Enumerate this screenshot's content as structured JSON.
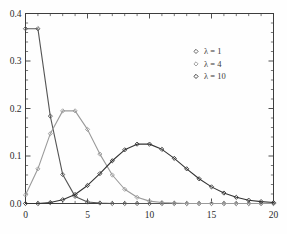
{
  "chart_data": {
    "type": "line",
    "title": "",
    "subtitle": "",
    "xlabel": "",
    "ylabel": "",
    "xlim": [
      0,
      20
    ],
    "ylim": [
      0.0,
      0.4
    ],
    "grid": false,
    "legend_position": "top-right",
    "x_ticks": [
      0,
      5,
      10,
      15,
      20
    ],
    "x_tick_labels": [
      "0",
      "5",
      "10",
      "15",
      "20"
    ],
    "y_ticks": [
      0.0,
      0.1,
      0.2,
      0.3,
      0.4
    ],
    "y_tick_labels": [
      "0.0",
      "0.1",
      "0.2",
      "0.3",
      "0.4"
    ],
    "x_minor_tick_step": 1,
    "y_minor_tick_step": 0.02,
    "marker": "diamond",
    "x": [
      0,
      1,
      2,
      3,
      4,
      5,
      6,
      7,
      8,
      9,
      10,
      11,
      12,
      13,
      14,
      15,
      16,
      17,
      18,
      19,
      20
    ],
    "series": [
      {
        "name": "λ = 1",
        "color": "#555555",
        "values": [
          0.368,
          0.368,
          0.184,
          0.061,
          0.015,
          0.003,
          0.001,
          0.0,
          0.0,
          0.0,
          0.0,
          0.0,
          0.0,
          0.0,
          0.0,
          0.0,
          0.0,
          0.0,
          0.0,
          0.0,
          0.0
        ]
      },
      {
        "name": "λ = 4",
        "color": "#9a9a9a",
        "values": [
          0.018,
          0.073,
          0.147,
          0.195,
          0.195,
          0.156,
          0.104,
          0.06,
          0.03,
          0.013,
          0.005,
          0.002,
          0.001,
          0.0,
          0.0,
          0.0,
          0.0,
          0.0,
          0.0,
          0.0,
          0.0
        ]
      },
      {
        "name": "λ = 10",
        "color": "#333333",
        "values": [
          0.0,
          0.0,
          0.002,
          0.008,
          0.019,
          0.038,
          0.063,
          0.09,
          0.113,
          0.125,
          0.125,
          0.114,
          0.095,
          0.073,
          0.052,
          0.035,
          0.022,
          0.013,
          0.007,
          0.004,
          0.002
        ]
      }
    ]
  },
  "legend": {
    "entries": [
      {
        "label": "λ = 1"
      },
      {
        "label": "λ = 4"
      },
      {
        "label": "λ = 10"
      }
    ]
  },
  "axes": {
    "x_labels": [
      "0",
      "5",
      "10",
      "15",
      "20"
    ],
    "y_labels": [
      "0.0",
      "0.1",
      "0.2",
      "0.3",
      "0.4"
    ]
  },
  "colors": {
    "axis": "#3d3d3d",
    "background": "#fefefe",
    "lambda1": "#555555",
    "lambda4": "#9a9a9a",
    "lambda10": "#333333"
  }
}
